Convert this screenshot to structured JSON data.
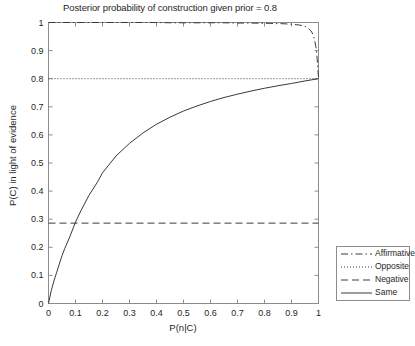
{
  "chart_data": {
    "type": "line",
    "title": "Posterior probability of construction given prior = 0.8",
    "xlabel": "P(n|C)",
    "ylabel": "P(C) in light of evidence",
    "xlim": [
      0,
      1
    ],
    "ylim": [
      0,
      1
    ],
    "grid": false,
    "legend_position": "outside-right-bottom",
    "xticks": [
      "0",
      "0.1",
      "0.2",
      "0.3",
      "0.4",
      "0.5",
      "0.6",
      "0.7",
      "0.8",
      "0.9",
      "1"
    ],
    "xtick_values": [
      0,
      0.1,
      0.2,
      0.3,
      0.4,
      0.5,
      0.6,
      0.7,
      0.8,
      0.9,
      1
    ],
    "yticks": [
      "0",
      "0.1",
      "0.2",
      "0.3",
      "0.4",
      "0.5",
      "0.6",
      "0.7",
      "0.8",
      "0.9",
      "1"
    ],
    "ytick_values": [
      0,
      0.1,
      0.2,
      0.3,
      0.4,
      0.5,
      0.6,
      0.7,
      0.8,
      0.9,
      1
    ],
    "prior": 0.8,
    "series": [
      {
        "name": "Affirmative",
        "style": "dash-dot",
        "color": "#3a3a3a",
        "x": [
          0,
          0.05,
          0.1,
          0.15,
          0.2,
          0.25,
          0.3,
          0.35,
          0.4,
          0.45,
          0.5,
          0.55,
          0.6,
          0.65,
          0.7,
          0.75,
          0.8,
          0.82,
          0.84,
          0.86,
          0.88,
          0.9,
          0.92,
          0.93,
          0.94,
          0.95,
          0.96,
          0.97,
          0.975,
          0.98,
          0.985,
          0.99,
          0.995,
          0.998,
          1
        ],
        "values": [
          1,
          1,
          1,
          1,
          1,
          1,
          1,
          1,
          1,
          0.999,
          0.999,
          0.999,
          0.999,
          0.999,
          0.998,
          0.998,
          0.997,
          0.997,
          0.996,
          0.996,
          0.995,
          0.994,
          0.992,
          0.991,
          0.989,
          0.986,
          0.981,
          0.972,
          0.966,
          0.956,
          0.94,
          0.915,
          0.871,
          0.833,
          0.8
        ]
      },
      {
        "name": "Opposite",
        "style": "dotted",
        "color": "#3a3a3a",
        "x": [
          0,
          1
        ],
        "values": [
          0.8,
          0.8
        ]
      },
      {
        "name": "Negative",
        "style": "dashed",
        "color": "#3a3a3a",
        "x": [
          0,
          1
        ],
        "values": [
          0.286,
          0.286
        ]
      },
      {
        "name": "Same",
        "style": "solid",
        "color": "#3a3a3a",
        "x": [
          0,
          0.01,
          0.02,
          0.03,
          0.04,
          0.05,
          0.06,
          0.08,
          0.1,
          0.12,
          0.15,
          0.18,
          0.2,
          0.25,
          0.3,
          0.35,
          0.4,
          0.45,
          0.5,
          0.55,
          0.6,
          0.65,
          0.7,
          0.75,
          0.8,
          0.85,
          0.9,
          0.95,
          1
        ],
        "values": [
          0,
          0.045,
          0.08,
          0.11,
          0.14,
          0.17,
          0.195,
          0.24,
          0.29,
          0.33,
          0.385,
          0.43,
          0.465,
          0.525,
          0.57,
          0.607,
          0.638,
          0.663,
          0.685,
          0.703,
          0.719,
          0.733,
          0.745,
          0.756,
          0.766,
          0.775,
          0.783,
          0.792,
          0.8
        ]
      }
    ]
  },
  "legend": {
    "items": [
      {
        "label": "Affirmative",
        "style": "dash-dot"
      },
      {
        "label": "Opposite",
        "style": "dotted"
      },
      {
        "label": "Negative",
        "style": "dashed"
      },
      {
        "label": "Same",
        "style": "solid"
      }
    ]
  },
  "colors": {
    "axis": "#8c8c8c",
    "line": "#3a3a3a",
    "text": "#1f1f1f",
    "background": "#ffffff"
  }
}
